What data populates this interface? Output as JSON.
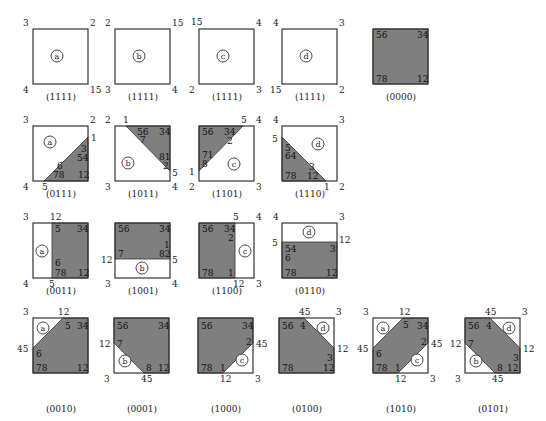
{
  "colors": {
    "fill": "#7f7f7f",
    "stroke": "#333333",
    "background": "#ffffff"
  },
  "diagrams": [
    {
      "id": "a-1111",
      "caption": "(1111)",
      "x": 33,
      "y": 29,
      "region": "a",
      "polys": [],
      "circle": [
        24,
        27
      ],
      "corners": [
        {
          "t": "3",
          "x": -10,
          "y": -10
        },
        {
          "t": "2",
          "x": 57,
          "y": -10
        },
        {
          "t": "4",
          "x": -10,
          "y": 57
        },
        {
          "t": "15",
          "x": 57,
          "y": 57
        }
      ],
      "inner": []
    },
    {
      "id": "b-1111",
      "caption": "(1111)",
      "x": 115,
      "y": 29,
      "region": "b",
      "polys": [],
      "circle": [
        24,
        27
      ],
      "corners": [
        {
          "t": "2",
          "x": -10,
          "y": -10
        },
        {
          "t": "15",
          "x": 57,
          "y": -10
        },
        {
          "t": "3",
          "x": -10,
          "y": 57
        },
        {
          "t": "4",
          "x": 57,
          "y": 57
        }
      ],
      "inner": []
    },
    {
      "id": "c-1111",
      "caption": "(1111)",
      "x": 199,
      "y": 29,
      "region": "c",
      "polys": [],
      "circle": [
        24,
        27
      ],
      "corners": [
        {
          "t": "15",
          "x": -8,
          "y": -11
        },
        {
          "t": "4",
          "x": 57,
          "y": -10
        },
        {
          "t": "2",
          "x": -10,
          "y": 57
        },
        {
          "t": "3",
          "x": 57,
          "y": 57
        }
      ],
      "inner": []
    },
    {
      "id": "d-1111",
      "caption": "(1111)",
      "x": 282,
      "y": 29,
      "region": "d",
      "polys": [],
      "circle": [
        24,
        27
      ],
      "corners": [
        {
          "t": "4",
          "x": -9,
          "y": -10
        },
        {
          "t": "3",
          "x": 57,
          "y": -10
        },
        {
          "t": "15",
          "x": -12,
          "y": 57
        },
        {
          "t": "2",
          "x": 57,
          "y": 57
        }
      ],
      "inner": []
    },
    {
      "id": "0000",
      "caption": "(0000)",
      "x": 373,
      "y": 29,
      "region": "",
      "polys": [
        "0,0 55,0 55,55 0,55"
      ],
      "circle": null,
      "corners": [],
      "inner": [
        {
          "t": "56",
          "x": 3,
          "y": 2
        },
        {
          "t": "34",
          "x": 44,
          "y": 2
        },
        {
          "t": "78",
          "x": 3,
          "y": 46
        },
        {
          "t": "12",
          "x": 44,
          "y": 46
        }
      ]
    },
    {
      "id": "0111",
      "caption": "(0111)",
      "x": 33,
      "y": 126,
      "region": "a",
      "polys": [
        "55,11 55,55 11,55"
      ],
      "circle": [
        17,
        16
      ],
      "corners": [
        {
          "t": "3",
          "x": -10,
          "y": -10
        },
        {
          "t": "2",
          "x": 57,
          "y": -10
        },
        {
          "t": "1",
          "x": 58,
          "y": 8
        },
        {
          "t": "4",
          "x": -10,
          "y": 57
        },
        {
          "t": "5",
          "x": 9,
          "y": 57
        }
      ],
      "inner": [
        {
          "t": "3",
          "x": 48,
          "y": 19
        },
        {
          "t": "54",
          "x": 44,
          "y": 28
        },
        {
          "t": "6",
          "x": 24,
          "y": 36
        },
        {
          "t": "78",
          "x": 20,
          "y": 45
        },
        {
          "t": "12",
          "x": 45,
          "y": 45
        }
      ]
    },
    {
      "id": "1011",
      "caption": "(1011)",
      "x": 115,
      "y": 126,
      "region": "b",
      "polys": [
        "11,0 55,0 55,45"
      ],
      "circle": [
        13,
        37
      ],
      "corners": [
        {
          "t": "2",
          "x": -10,
          "y": -10
        },
        {
          "t": "1",
          "x": 8,
          "y": -10
        },
        {
          "t": "5",
          "x": 57,
          "y": 43
        },
        {
          "t": "3",
          "x": -10,
          "y": 57
        },
        {
          "t": "4",
          "x": 57,
          "y": 57
        }
      ],
      "inner": [
        {
          "t": "56",
          "x": 22,
          "y": 2
        },
        {
          "t": "7",
          "x": 25,
          "y": 10
        },
        {
          "t": "34",
          "x": 44,
          "y": 2
        },
        {
          "t": "81",
          "x": 44,
          "y": 27
        },
        {
          "t": "2",
          "x": 48,
          "y": 36
        }
      ]
    },
    {
      "id": "1101",
      "caption": "(1101)",
      "x": 199,
      "y": 126,
      "region": "c",
      "polys": [
        "0,0 44,0 0,45"
      ],
      "circle": [
        35,
        38
      ],
      "corners": [
        {
          "t": "5",
          "x": 42,
          "y": -10
        },
        {
          "t": "4",
          "x": 57,
          "y": -10
        },
        {
          "t": "1",
          "x": -10,
          "y": 42
        },
        {
          "t": "2",
          "x": -10,
          "y": 57
        },
        {
          "t": "3",
          "x": 57,
          "y": 57
        }
      ],
      "inner": [
        {
          "t": "56",
          "x": 3,
          "y": 2
        },
        {
          "t": "34",
          "x": 25,
          "y": 2
        },
        {
          "t": "2",
          "x": 28,
          "y": 11
        },
        {
          "t": "71",
          "x": 3,
          "y": 25
        },
        {
          "t": "8",
          "x": 3,
          "y": 34
        }
      ]
    },
    {
      "id": "1110",
      "caption": "(1110)",
      "x": 282,
      "y": 126,
      "region": "d",
      "polys": [
        "0,11 0,55 44,55"
      ],
      "circle": [
        36,
        18
      ],
      "corners": [
        {
          "t": "4",
          "x": -9,
          "y": -10
        },
        {
          "t": "3",
          "x": 57,
          "y": -10
        },
        {
          "t": "5",
          "x": -10,
          "y": 9
        },
        {
          "t": "1",
          "x": 42,
          "y": 57
        },
        {
          "t": "2",
          "x": 57,
          "y": 57
        }
      ],
      "inner": [
        {
          "t": "5",
          "x": 3,
          "y": 18
        },
        {
          "t": "64",
          "x": 3,
          "y": 26
        },
        {
          "t": "3",
          "x": 27,
          "y": 37
        },
        {
          "t": "12",
          "x": 25,
          "y": 46
        },
        {
          "t": "78",
          "x": 3,
          "y": 46
        }
      ]
    },
    {
      "id": "0011",
      "caption": "(0011)",
      "x": 33,
      "y": 223,
      "region": "a",
      "polys": [
        "19,0 55,0 55,55 19,55"
      ],
      "circle": [
        9,
        28
      ],
      "corners": [
        {
          "t": "3",
          "x": -10,
          "y": -10
        },
        {
          "t": "12",
          "x": 17,
          "y": -10
        },
        {
          "t": "4",
          "x": -10,
          "y": 57
        },
        {
          "t": "5",
          "x": 16,
          "y": 57
        }
      ],
      "inner": [
        {
          "t": "5",
          "x": 22,
          "y": 2
        },
        {
          "t": "34",
          "x": 44,
          "y": 2
        },
        {
          "t": "6",
          "x": 22,
          "y": 36
        },
        {
          "t": "78",
          "x": 22,
          "y": 46
        },
        {
          "t": "12",
          "x": 45,
          "y": 46
        }
      ]
    },
    {
      "id": "1001",
      "caption": "(1001)",
      "x": 115,
      "y": 223,
      "region": "b",
      "polys": [
        "0,0 55,0 55,36 0,36"
      ],
      "circle": [
        27,
        45
      ],
      "corners": [
        {
          "t": "12",
          "x": -14,
          "y": 33
        },
        {
          "t": "5",
          "x": 57,
          "y": 33
        },
        {
          "t": "3",
          "x": -10,
          "y": 57
        },
        {
          "t": "4",
          "x": 57,
          "y": 57
        }
      ],
      "inner": [
        {
          "t": "56",
          "x": 3,
          "y": 2
        },
        {
          "t": "34",
          "x": 44,
          "y": 2
        },
        {
          "t": "1",
          "x": 49,
          "y": 18
        },
        {
          "t": "7",
          "x": 3,
          "y": 27
        },
        {
          "t": "82",
          "x": 44,
          "y": 27
        }
      ]
    },
    {
      "id": "1100",
      "caption": "(1100)",
      "x": 199,
      "y": 223,
      "region": "c",
      "polys": [
        "0,0 36,0 36,55 0,55"
      ],
      "circle": [
        46,
        28
      ],
      "corners": [
        {
          "t": "5",
          "x": 34,
          "y": -10
        },
        {
          "t": "4",
          "x": 57,
          "y": -10
        },
        {
          "t": "12",
          "x": 34,
          "y": 57
        },
        {
          "t": "3",
          "x": 57,
          "y": 57
        }
      ],
      "inner": [
        {
          "t": "56",
          "x": 3,
          "y": 2
        },
        {
          "t": "34",
          "x": 25,
          "y": 2
        },
        {
          "t": "2",
          "x": 29,
          "y": 11
        },
        {
          "t": "78",
          "x": 3,
          "y": 46
        },
        {
          "t": "1",
          "x": 29,
          "y": 46
        }
      ]
    },
    {
      "id": "0110",
      "caption": "(0110)",
      "x": 282,
      "y": 223,
      "region": "d",
      "polys": [
        "0,19 55,19 55,55 0,55"
      ],
      "circle": [
        27,
        9
      ],
      "corners": [
        {
          "t": "4",
          "x": -9,
          "y": -10
        },
        {
          "t": "3",
          "x": 57,
          "y": -10
        },
        {
          "t": "5",
          "x": -10,
          "y": 16
        },
        {
          "t": "12",
          "x": 57,
          "y": 13
        }
      ],
      "inner": [
        {
          "t": "54",
          "x": 3,
          "y": 22
        },
        {
          "t": "3",
          "x": 48,
          "y": 22
        },
        {
          "t": "6",
          "x": 3,
          "y": 31
        },
        {
          "t": "78",
          "x": 3,
          "y": 46
        },
        {
          "t": "12",
          "x": 44,
          "y": 46
        }
      ]
    },
    {
      "id": "0010",
      "caption": "(0010)",
      "x": 33,
      "y": 318,
      "region": "a",
      "polys": [
        "30,0 55,0 55,55 0,55 0,30"
      ],
      "circle": [
        10,
        10
      ],
      "corners": [
        {
          "t": "3",
          "x": -10,
          "y": -10
        },
        {
          "t": "12",
          "x": 25,
          "y": -10
        },
        {
          "t": "45",
          "x": -16,
          "y": 27
        }
      ],
      "inner": [
        {
          "t": "5",
          "x": 32,
          "y": 4
        },
        {
          "t": "34",
          "x": 44,
          "y": 4
        },
        {
          "t": "6",
          "x": 3,
          "y": 32
        },
        {
          "t": "78",
          "x": 3,
          "y": 46
        },
        {
          "t": "12",
          "x": 44,
          "y": 46
        }
      ]
    },
    {
      "id": "0001",
      "caption": "(0001)",
      "x": 114,
      "y": 318,
      "region": "b",
      "polys": [
        "0,0 55,0 55,55 30,55 0,25"
      ],
      "circle": [
        11,
        43
      ],
      "corners": [
        {
          "t": "12",
          "x": -15,
          "y": 22
        },
        {
          "t": "3",
          "x": -10,
          "y": 57
        },
        {
          "t": "45",
          "x": 27,
          "y": 57
        }
      ],
      "inner": [
        {
          "t": "56",
          "x": 3,
          "y": 4
        },
        {
          "t": "34",
          "x": 44,
          "y": 4
        },
        {
          "t": "7",
          "x": 3,
          "y": 22
        },
        {
          "t": "8",
          "x": 32,
          "y": 46
        },
        {
          "t": "12",
          "x": 44,
          "y": 46
        }
      ]
    },
    {
      "id": "1000",
      "caption": "(1000)",
      "x": 198,
      "y": 318,
      "region": "c",
      "polys": [
        "0,0 55,0 55,25 25,55 0,55"
      ],
      "circle": [
        44,
        42
      ],
      "corners": [
        {
          "t": "45",
          "x": 58,
          "y": 22
        },
        {
          "t": "12",
          "x": 22,
          "y": 57
        },
        {
          "t": "3",
          "x": 57,
          "y": 57
        }
      ],
      "inner": [
        {
          "t": "56",
          "x": 3,
          "y": 4
        },
        {
          "t": "34",
          "x": 44,
          "y": 4
        },
        {
          "t": "2",
          "x": 48,
          "y": 20
        },
        {
          "t": "78",
          "x": 3,
          "y": 46
        },
        {
          "t": "1",
          "x": 22,
          "y": 46
        }
      ]
    },
    {
      "id": "0100",
      "caption": "(0100)",
      "x": 279,
      "y": 318,
      "region": "d",
      "polys": [
        "0,0 25,0 55,30 55,55 0,55"
      ],
      "circle": [
        44,
        10
      ],
      "corners": [
        {
          "t": "45",
          "x": 20,
          "y": -10
        },
        {
          "t": "3",
          "x": 57,
          "y": -10
        },
        {
          "t": "12",
          "x": 58,
          "y": 27
        }
      ],
      "inner": [
        {
          "t": "56",
          "x": 3,
          "y": 4
        },
        {
          "t": "4",
          "x": 21,
          "y": 4
        },
        {
          "t": "3",
          "x": 48,
          "y": 36
        },
        {
          "t": "78",
          "x": 3,
          "y": 46
        },
        {
          "t": "12",
          "x": 44,
          "y": 46
        }
      ]
    },
    {
      "id": "1010",
      "caption": "(1010)",
      "x": 373,
      "y": 318,
      "region": "ac",
      "polys": [
        "30,0 55,0 55,25 25,55 0,55 0,30"
      ],
      "circle": [
        10,
        10
      ],
      "circle2": [
        44,
        42
      ],
      "corners": [
        {
          "t": "3",
          "x": -10,
          "y": -10
        },
        {
          "t": "12",
          "x": 26,
          "y": -10
        },
        {
          "t": "45",
          "x": -16,
          "y": 27
        },
        {
          "t": "45",
          "x": 58,
          "y": 22
        },
        {
          "t": "12",
          "x": 22,
          "y": 57
        },
        {
          "t": "3",
          "x": 57,
          "y": 57
        }
      ],
      "inner": [
        {
          "t": "5",
          "x": 30,
          "y": 3
        },
        {
          "t": "34",
          "x": 44,
          "y": 4
        },
        {
          "t": "2",
          "x": 48,
          "y": 20
        },
        {
          "t": "6",
          "x": 3,
          "y": 32
        },
        {
          "t": "78",
          "x": 3,
          "y": 46
        },
        {
          "t": "1",
          "x": 22,
          "y": 46
        }
      ]
    },
    {
      "id": "0101",
      "caption": "(0101)",
      "x": 465,
      "y": 318,
      "region": "bd",
      "polys": [
        "0,0 25,0 55,30 55,55 30,55 0,25"
      ],
      "circle": [
        11,
        43
      ],
      "circle2": [
        44,
        10
      ],
      "corners": [
        {
          "t": "45",
          "x": 20,
          "y": -10
        },
        {
          "t": "3",
          "x": 57,
          "y": -10
        },
        {
          "t": "12",
          "x": -15,
          "y": 22
        },
        {
          "t": "12",
          "x": 58,
          "y": 27
        },
        {
          "t": "3",
          "x": -10,
          "y": 57
        },
        {
          "t": "45",
          "x": 27,
          "y": 57
        }
      ],
      "inner": [
        {
          "t": "56",
          "x": 3,
          "y": 4
        },
        {
          "t": "4",
          "x": 21,
          "y": 4
        },
        {
          "t": "7",
          "x": 3,
          "y": 22
        },
        {
          "t": "3",
          "x": 48,
          "y": 36
        },
        {
          "t": "8",
          "x": 32,
          "y": 46
        },
        {
          "t": "12",
          "x": 42,
          "y": 46
        }
      ]
    }
  ]
}
